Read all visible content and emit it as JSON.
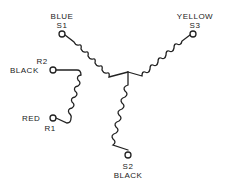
{
  "diagram": {
    "type": "wye-connected motor winding schematic",
    "terminals": {
      "s1": {
        "id": "S1",
        "color_label": "BLUE"
      },
      "s2": {
        "id": "S2",
        "color_label": "BLACK"
      },
      "s3": {
        "id": "S3",
        "color_label": "YELLOW"
      },
      "r1": {
        "id": "R1",
        "color_label": "RED"
      },
      "r2": {
        "id": "R2",
        "color_label": "BLACK"
      }
    },
    "colors": {
      "line": "#222222",
      "background": "#ffffff"
    }
  }
}
